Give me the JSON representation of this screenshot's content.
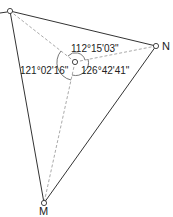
{
  "diagram": {
    "type": "survey-angle-diagram",
    "colors": {
      "line": "#333333",
      "dashed": "#aaaaaa",
      "arc": "#555555",
      "text": "#222222"
    },
    "points": {
      "A": {
        "label": "",
        "x": 10,
        "y": 11
      },
      "N": {
        "label": "N",
        "x": 156,
        "y": 46
      },
      "O": {
        "label": "",
        "x": 75,
        "y": 62
      },
      "M": {
        "label": "M",
        "x": 44,
        "y": 203
      }
    },
    "angles": [
      {
        "id": "angle-a-o-m",
        "value": "121°02'16\""
      },
      {
        "id": "angle-a-o-n",
        "value": "112°15'03\""
      },
      {
        "id": "angle-n-o-m",
        "value": "126°42'41\""
      }
    ],
    "labels": {
      "N": "N",
      "M": "M"
    }
  }
}
